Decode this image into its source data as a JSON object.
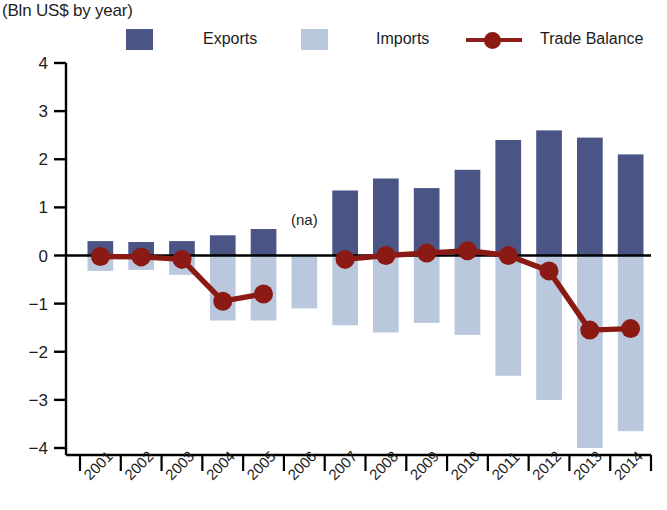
{
  "header": {
    "title": "",
    "subtitle": "(Bln US$ by year)"
  },
  "legend": {
    "position": "top",
    "items": [
      {
        "key": "exports",
        "label": "Exports",
        "color": "#4b5585",
        "marker": "square"
      },
      {
        "key": "imports",
        "label": "Imports",
        "color": "#b9c8dc",
        "marker": "square"
      },
      {
        "key": "balance",
        "label": "Trade Balance",
        "color": "#8b1a14",
        "marker": "line-dot"
      }
    ]
  },
  "annotations": [
    {
      "name": "na-2006",
      "text": "(na)",
      "x_category": "2006",
      "y_value": 0.55
    }
  ],
  "colors": {
    "exports": "#4b5585",
    "imports": "#b9c8dc",
    "balance": "#8b1a14",
    "axis": "#000000",
    "text": "#1c1c1c",
    "background": "#ffffff"
  },
  "chart_data": {
    "type": "bar",
    "title": "",
    "subtitle": "(Bln US$ by year)",
    "xlabel": "",
    "ylabel": "",
    "ylim": [
      -4,
      4
    ],
    "yticks": [
      4,
      3,
      2,
      1,
      0,
      -1,
      -2,
      -3,
      -4
    ],
    "ytick_labels": [
      "4",
      "3",
      "2",
      "1",
      "0",
      "−1",
      "−2",
      "−3",
      "−4"
    ],
    "grid": false,
    "legend_position": "top",
    "categories": [
      "2001",
      "2002",
      "2003",
      "2004",
      "2005",
      "2006",
      "2007",
      "2008",
      "2009",
      "2010",
      "2011",
      "2012",
      "2013",
      "2014"
    ],
    "series": [
      {
        "name": "Exports",
        "type": "bar",
        "color": "#4b5585",
        "values": [
          0.3,
          0.28,
          0.3,
          0.42,
          0.55,
          null,
          1.35,
          1.6,
          1.4,
          1.78,
          2.4,
          2.6,
          2.45,
          2.1
        ]
      },
      {
        "name": "Imports",
        "type": "bar",
        "color": "#b9c8dc",
        "values": [
          -0.32,
          -0.3,
          -0.4,
          -1.35,
          -1.35,
          -1.1,
          -1.45,
          -1.6,
          -1.4,
          -1.65,
          -2.5,
          -3.0,
          -4.0,
          -3.65
        ]
      },
      {
        "name": "Trade Balance",
        "type": "line",
        "color": "#8b1a14",
        "values": [
          -0.02,
          -0.03,
          -0.08,
          -0.95,
          -0.8,
          null,
          -0.08,
          0.0,
          0.05,
          0.1,
          0.0,
          -0.32,
          -1.55,
          -1.52
        ]
      }
    ]
  }
}
